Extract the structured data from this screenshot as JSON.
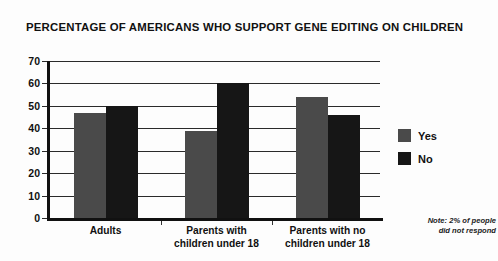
{
  "chart_data": {
    "type": "bar",
    "title": "PERCENTAGE OF AMERICANS WHO SUPPORT GENE EDITING ON CHILDREN",
    "xlabel": "",
    "ylabel": "",
    "ylim": [
      0,
      70
    ],
    "yticks": [
      0,
      10,
      20,
      30,
      40,
      50,
      60,
      70
    ],
    "ytick_labels": [
      "0",
      "10",
      "20",
      "30",
      "40",
      "50",
      "60",
      "70"
    ],
    "grid": true,
    "legend_position": "right",
    "categories": [
      "Adults",
      "Parents with children under 18",
      "Parents with no children under 18"
    ],
    "category_lines": [
      [
        "Adults"
      ],
      [
        "Parents with",
        "children under 18"
      ],
      [
        "Parents with no",
        "children under 18"
      ]
    ],
    "series": [
      {
        "name": "Yes",
        "color": "#4a4a4a",
        "values": [
          47,
          39,
          54
        ]
      },
      {
        "name": "No",
        "color": "#161616",
        "values": [
          50,
          60,
          46
        ]
      }
    ],
    "annotation": "Note: 2% of people did not respond",
    "annotation_lines": [
      "Note: 2% of people",
      "did not respond"
    ]
  }
}
